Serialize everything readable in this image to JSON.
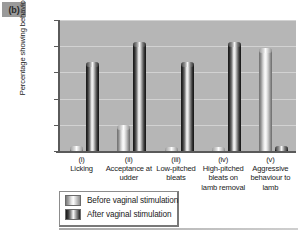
{
  "panel": {
    "tag": "(b)"
  },
  "chart_data": {
    "type": "bar",
    "title": "",
    "xlabel": "",
    "ylabel": "Percentage showing behaviour",
    "ylim": [
      0,
      100
    ],
    "yticks": [
      0,
      20,
      40,
      60,
      80,
      100
    ],
    "grid": true,
    "legend_position": "bottom-left",
    "categories": [
      {
        "roman": "(i)",
        "name": "Licking"
      },
      {
        "roman": "(ii)",
        "name": "Acceptance at udder"
      },
      {
        "roman": "(iii)",
        "name": "Low-pitched bleats"
      },
      {
        "roman": "(iv)",
        "name": "High-pitched bleats on lamb removal"
      },
      {
        "roman": "(v)",
        "name": "Aggressive behaviour to lamb"
      }
    ],
    "series": [
      {
        "name": "Before vaginal stimulation",
        "values": [
          4,
          20,
          3,
          3,
          79
        ]
      },
      {
        "name": "After vaginal stimulation",
        "values": [
          68,
          83,
          68,
          83,
          4
        ]
      }
    ]
  },
  "colors": {
    "plot_background": "#b6b6b6",
    "gridline": "#d2d2d2",
    "axis": "#5a5a5a",
    "panel_tag_background": "#9a9a9a",
    "text": "#1a1a1a"
  }
}
